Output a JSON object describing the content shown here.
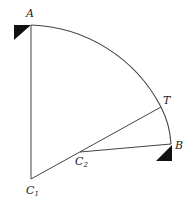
{
  "diagram": {
    "type": "compound-curve",
    "colors": {
      "line": "#444444",
      "support": "#111111",
      "text": "#222222"
    },
    "points": {
      "A": {
        "label": "A",
        "x": 31,
        "y": 25
      },
      "T": {
        "label": "T",
        "x": 161,
        "y": 107
      },
      "B": {
        "label": "B",
        "x": 171,
        "y": 144
      },
      "C1": {
        "label": "C",
        "sub": "1",
        "x": 31,
        "y": 179
      },
      "C2": {
        "label": "C",
        "sub": "2",
        "x": 80,
        "y": 152
      }
    },
    "segments": [
      {
        "from": "A",
        "to": "C1",
        "kind": "radius"
      },
      {
        "from": "C1",
        "to": "T",
        "kind": "radius"
      },
      {
        "from": "C2",
        "to": "B",
        "kind": "radius"
      },
      {
        "from": "A",
        "to": "T",
        "kind": "arc",
        "center": "C1"
      },
      {
        "from": "T",
        "to": "B",
        "kind": "arc",
        "center": "C2"
      }
    ],
    "supports": [
      "A",
      "B"
    ]
  }
}
